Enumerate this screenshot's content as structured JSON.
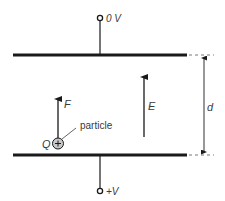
{
  "diagram": {
    "type": "parallel-plate-capacitor-field",
    "top_terminal": {
      "label": "0 V"
    },
    "bottom_terminal": {
      "label": "+V"
    },
    "field": {
      "label": "E",
      "direction": "up"
    },
    "force": {
      "label": "F",
      "direction": "up"
    },
    "charge": {
      "label": "Q",
      "symbol": "+",
      "callout": "particle"
    },
    "separation": {
      "label": "d"
    },
    "colors": {
      "line": "#1a1a1a",
      "text": "#3a3a3a",
      "particle_fill": "#c8c8c8"
    }
  }
}
